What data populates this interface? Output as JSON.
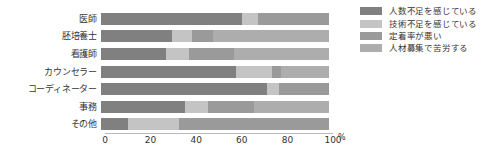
{
  "chart_data": {
    "type": "bar",
    "orientation": "horizontal",
    "stacked": true,
    "normalized": true,
    "title": "",
    "xlabel": "",
    "ylabel": "",
    "unit": "%",
    "xlim": [
      0,
      100
    ],
    "xticks": [
      0,
      20,
      40,
      60,
      80,
      100
    ],
    "xticklabels": [
      "0",
      "20",
      "40",
      "60",
      "80",
      "100"
    ],
    "grid": false,
    "legend_position": "right",
    "categories": [
      "医師",
      "胚培養士",
      "看護師",
      "カウンセラー",
      "コーディネーター",
      "事務",
      "その他"
    ],
    "series": [
      {
        "name": "人数不足を感じている",
        "color": "#808080",
        "values": [
          62,
          31,
          28.5,
          59,
          73,
          37,
          12
        ]
      },
      {
        "name": "技術不足を感じている",
        "color": "#c4c4c4",
        "values": [
          7,
          9,
          10,
          16,
          5,
          10,
          22
        ]
      },
      {
        "name": "定着率が悪い",
        "color": "#9a9a9a",
        "values": [
          31,
          9,
          20,
          4,
          22,
          20,
          66
        ]
      },
      {
        "name": "人材募集で苦労する",
        "color": "#adadad",
        "values": [
          0,
          51,
          41.5,
          21,
          0,
          33,
          0
        ]
      }
    ]
  },
  "axis": {
    "unit_label": "%"
  }
}
